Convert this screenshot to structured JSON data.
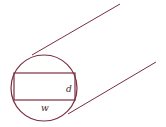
{
  "diagram": {
    "stroke_color": "#7a2e3e",
    "labels": {
      "depth": "d",
      "width": "w"
    },
    "shapes": {
      "circle": {
        "cx": 44,
        "cy": 88,
        "r": 33
      },
      "rectangle": {
        "x": 14,
        "y": 73,
        "width": 61,
        "height": 27
      },
      "top_tangent": {
        "x1": 32,
        "y1": 55,
        "x2": 120,
        "y2": 4
      },
      "bottom_tangent": {
        "x1": 68,
        "y1": 114,
        "x2": 156,
        "y2": 62
      }
    }
  }
}
